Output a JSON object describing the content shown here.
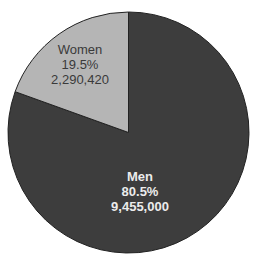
{
  "chart_data": {
    "type": "pie",
    "title": "",
    "categories": [
      "Men",
      "Women"
    ],
    "values": [
      9455000,
      2290420
    ],
    "percentages": [
      "80.5%",
      "19.5%"
    ],
    "colors": [
      "#3d3d3d",
      "#b5b5b5"
    ],
    "start_angle_deg": 0,
    "direction": "clockwise-men-from-top",
    "legend": "none",
    "labels": [
      {
        "name": "Men",
        "percent": "80.5%",
        "value": "9,455,000",
        "text_color": "#ececec"
      },
      {
        "name": "Women",
        "percent": "19.5%",
        "value": "2,290,420",
        "text_color": "#3a3a3a"
      }
    ]
  }
}
